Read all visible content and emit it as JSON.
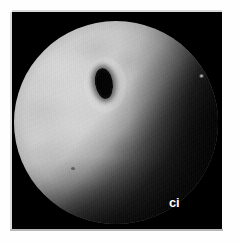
{
  "figure": {
    "kind": "endoscopic-photograph",
    "modality_label": "grayscale endoscopy still",
    "background_color": "#ffffff",
    "panel_color": "#000000"
  },
  "panel": {
    "x": 12,
    "y": 12,
    "width": 210,
    "height": 217
  },
  "scope_view": {
    "shape": "circle",
    "center_x": 104,
    "center_y": 119,
    "diameter": 204,
    "field_color_bright": "#d9d9d9",
    "field_color_dark": "#070707"
  },
  "features": {
    "lumen_opening": {
      "name": "lumen-opening",
      "center_x": 102,
      "center_y": 74,
      "width": 18,
      "height": 31,
      "color": "#000000"
    },
    "specular_highlight": {
      "name": "specular-highlight",
      "center_x": 199,
      "center_y": 67,
      "color": "#ffffff"
    },
    "shadow_wedge": {
      "name": "diagonal-shadow",
      "direction": "upper-right to lower-left",
      "color": "#000000"
    }
  },
  "annotation": {
    "label": "ci",
    "color": "#ffffff",
    "x": 163,
    "y": 193
  }
}
